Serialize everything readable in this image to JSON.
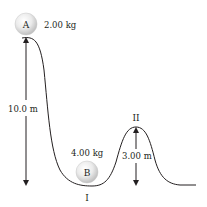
{
  "diagram": {
    "ball_a": {
      "label": "A",
      "mass": "2.00 kg"
    },
    "ball_b": {
      "label": "B",
      "mass": "4.00 kg"
    },
    "height_a": "10.0 m",
    "height_peak": "3.00 m",
    "point_valley": "I",
    "point_peak": "II",
    "colors": {
      "track": "#231f20",
      "ball_fill": "#e6e6e6",
      "ball_highlight": "#ffffff",
      "ball_edge": "#bdbdbd",
      "text": "#231f20"
    }
  }
}
